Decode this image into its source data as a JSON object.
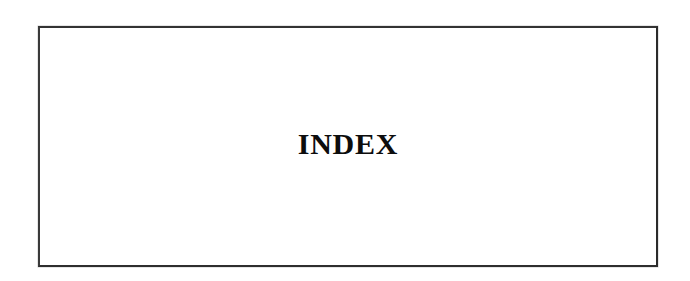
{
  "page": {
    "kind": "scanned-book-page",
    "background_color": "#ffffff",
    "width": 690,
    "height": 281
  },
  "frame": {
    "name": "index-section-divider-box",
    "border_color": "#333333",
    "border_width_px": 2,
    "fill_color": "#ffffff",
    "left": 38,
    "top": 26,
    "width": 620,
    "height": 241
  },
  "heading": {
    "text": "INDEX",
    "color": "#0d0d0d",
    "font_size_px": 30,
    "weight": "bold",
    "style": "serif",
    "align": "center"
  }
}
